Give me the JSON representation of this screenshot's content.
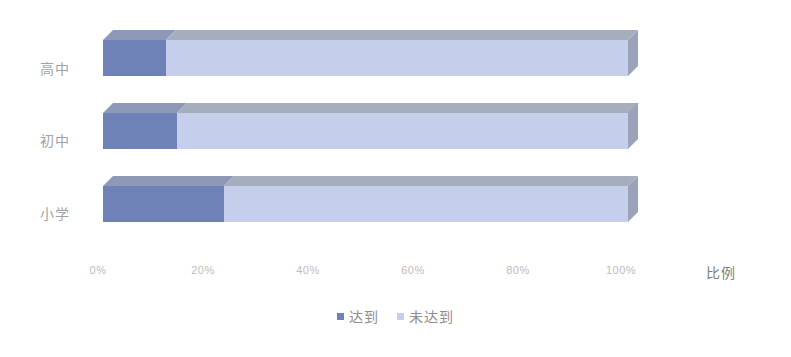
{
  "chart_data": {
    "type": "bar",
    "orientation": "horizontal",
    "stacked": true,
    "stack_total_percent": 100,
    "title": "",
    "subtitle": "",
    "xlabel": "比例",
    "ylabel": "",
    "xlim": [
      0,
      100
    ],
    "x_tick_labels": [
      "0%",
      "20%",
      "40%",
      "60%",
      "80%",
      "100%"
    ],
    "x_tick_values": [
      0,
      20,
      40,
      60,
      80,
      100
    ],
    "grid": false,
    "legend_position": "bottom-center",
    "categories": [
      "高中",
      "初中",
      "小学"
    ],
    "series": [
      {
        "name": "达到",
        "color": "#6f82b7",
        "values": [
          12,
          14,
          23
        ]
      },
      {
        "name": "未达到",
        "color": "#c5cfec",
        "values": [
          88,
          86,
          77
        ]
      }
    ],
    "annotations": []
  },
  "axis": {
    "y_labels": [
      "高中",
      "初中",
      "小学"
    ],
    "x_ticks": [
      "0%",
      "20%",
      "40%",
      "60%",
      "80%",
      "100%"
    ],
    "x_title": "比例"
  },
  "legend": {
    "items": [
      {
        "label": "达到",
        "color": "#6f82b7"
      },
      {
        "label": "未达到",
        "color": "#c5cfec"
      }
    ]
  },
  "style": {
    "background": "#ffffff",
    "series_dark": "#6f82b7",
    "series_light": "#c5cfec",
    "top_face_dark": "#8e99b7",
    "top_face_light": "#a6aebe",
    "side_face": "#9aa3b8",
    "tick_text": "#bcbcbc",
    "category_text": "#a3a3a3",
    "legend_text": "#8e8e8e"
  }
}
